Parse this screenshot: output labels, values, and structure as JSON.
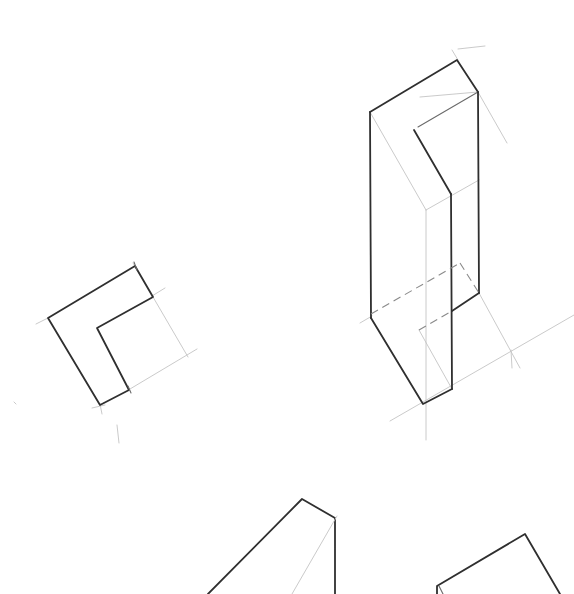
{
  "canvas": {
    "width": 574,
    "height": 594,
    "background": "#ffffff"
  },
  "sketch": {
    "title": "",
    "medium": "pencil isometric construction drawing",
    "figures": [
      {
        "name": "l-shape-profile",
        "description": "flat L-shaped outline with construction guide lines"
      },
      {
        "name": "l-prism-extruded",
        "description": "tall L-shaped prism with vertical edges, hidden dashed lines and guide lines"
      },
      {
        "name": "partial-shape-bottom-left",
        "description": "partially visible angled form cut off at bottom edge"
      },
      {
        "name": "partial-shape-bottom-right",
        "description": "partially visible box form cut off at bottom edge"
      }
    ],
    "colors": {
      "dark_line": "#2f2f2f",
      "mid_line": "#6a6a6a",
      "guide_line": "#c4c4c4"
    }
  }
}
